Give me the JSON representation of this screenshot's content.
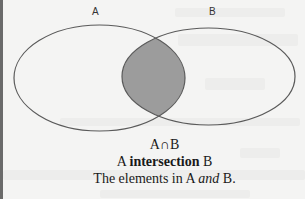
{
  "diagram": {
    "type": "venn",
    "sets": [
      {
        "label": "A",
        "shaded": false
      },
      {
        "label": "B",
        "shaded": false
      }
    ],
    "shaded_region": "A∩B",
    "colors": {
      "outline": "#5a5a5a",
      "intersection_fill": "#9c9c9c",
      "background": "#f4f4f3"
    }
  },
  "labels": {
    "set_a": "A",
    "set_b": "B"
  },
  "caption": {
    "symbol": "A∩B",
    "name_prefix": "A ",
    "name_bold": "intersection",
    "name_suffix": " B",
    "desc_prefix": "The elements in A ",
    "desc_italic": "and",
    "desc_suffix": " B."
  }
}
